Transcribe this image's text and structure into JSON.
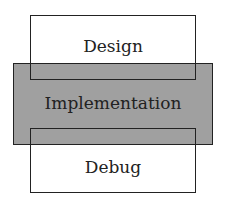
{
  "diagram": {
    "type": "overlapping-phases",
    "boxes": [
      {
        "label": "Design",
        "fill": "#ffffff"
      },
      {
        "label": "Implementation",
        "fill": "#a0a0a0"
      },
      {
        "label": "Debug",
        "fill": "#ffffff"
      }
    ]
  }
}
